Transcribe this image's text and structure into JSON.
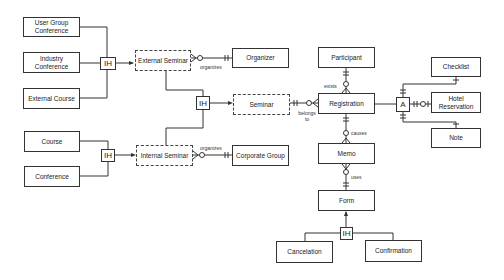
{
  "diagram": {
    "type": "entity-relationship",
    "entities": {
      "user_group_conference": "User Group Conference",
      "industry_conference": "Industry Conference",
      "external_course": "External Course",
      "external_seminar": "External Seminar",
      "organizer": "Organizer",
      "seminar": "Seminar",
      "course": "Course",
      "conference": "Conference",
      "internal_seminar": "Internal Seminar",
      "corporate_group": "Corporate Group",
      "participant": "Participant",
      "registration": "Registration",
      "checklist": "Checklist",
      "hotel_reservation": "Hotel Reservation",
      "note": "Note",
      "memo": "Memo",
      "form": "Form",
      "cancelation": "Cancelation",
      "confirmation": "Confirmation"
    },
    "connectors": {
      "ih1": "IH",
      "ih2": "IH",
      "ih3": "IH",
      "ih4": "IH",
      "aggregation": "A"
    },
    "relationship_labels": {
      "ext_organizes": "organizes",
      "int_organizes": "organizes",
      "exists": "exists",
      "belongs_to": "belongs to",
      "causes": "causes",
      "uses": "uses"
    }
  }
}
